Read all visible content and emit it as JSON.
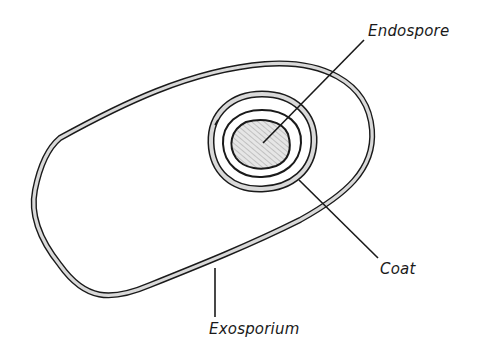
{
  "diagram": {
    "labels": {
      "endospore": "Endospore",
      "coat": "Coat",
      "exosporium": "Exosporium"
    },
    "colors": {
      "outline": "#1a1a1a",
      "layer_fill": "#d9d9d9",
      "core_hatch": "#bdbdbd",
      "background": "#ffffff"
    }
  }
}
